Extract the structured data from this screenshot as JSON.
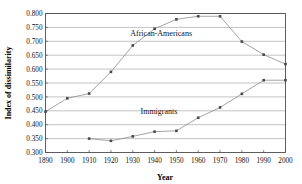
{
  "chart_data": {
    "type": "line",
    "title": "",
    "xlabel": "Year",
    "ylabel": "Index of dissimilarity",
    "x": [
      1890,
      1900,
      1910,
      1920,
      1930,
      1940,
      1950,
      1960,
      1970,
      1980,
      1990,
      2000
    ],
    "xlim": [
      1890,
      2000
    ],
    "ylim": [
      0.3,
      0.8
    ],
    "xticks": [
      "1890",
      "1900",
      "1910",
      "1920",
      "1930",
      "1940",
      "1950",
      "1960",
      "1970",
      "1980",
      "1990",
      "2000"
    ],
    "yticks": [
      "0.300",
      "0.350",
      "0.400",
      "0.450",
      "0.500",
      "0.550",
      "0.600",
      "0.650",
      "0.700",
      "0.750",
      "0.800"
    ],
    "ytick_values": [
      0.3,
      0.35,
      0.4,
      0.45,
      0.5,
      0.55,
      0.6,
      0.65,
      0.7,
      0.75,
      0.8
    ],
    "grid": "horizontal",
    "legend": "inline-annotations",
    "series": [
      {
        "name": "African-Americans",
        "x": [
          1890,
          1900,
          1910,
          1920,
          1930,
          1940,
          1950,
          1960,
          1970,
          1980,
          1990,
          2000
        ],
        "values": [
          0.447,
          0.495,
          0.512,
          0.59,
          0.685,
          0.745,
          0.779,
          0.79,
          0.79,
          0.699,
          0.652,
          0.618
        ],
        "color": "#8d8d8d",
        "marker": "square",
        "label_x": 1943,
        "label_y": 0.718
      },
      {
        "name": "Immigrants",
        "x": [
          1910,
          1920,
          1930,
          1940,
          1950,
          1960,
          1970,
          1980,
          1990,
          2000
        ],
        "values": [
          0.35,
          0.342,
          0.358,
          0.375,
          0.378,
          0.425,
          0.462,
          0.511,
          0.56,
          0.56
        ],
        "color": "#8d8d8d",
        "marker": "square",
        "label_x": 1942,
        "label_y": 0.437
      }
    ]
  },
  "axis": {
    "x_title": "Year",
    "y_title": "Index of dissimilarity"
  }
}
